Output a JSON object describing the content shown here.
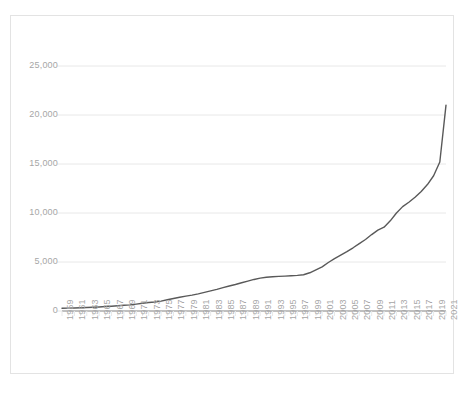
{
  "chart_data": {
    "type": "line",
    "title": "",
    "subtitle": "",
    "xlabel": "",
    "ylabel": "",
    "ylim": [
      0,
      25000
    ],
    "xlim": [
      1959,
      2021
    ],
    "y_ticks": [
      0,
      5000,
      10000,
      15000,
      20000,
      25000
    ],
    "y_tick_labels": [
      "0",
      "5,000",
      "10,000",
      "15,000",
      "20,000",
      "25,000"
    ],
    "x_tick_labels": [
      "1959",
      "1961",
      "1963",
      "1965",
      "1967",
      "1969",
      "1971",
      "1973",
      "1975",
      "1977",
      "1979",
      "1981",
      "1983",
      "1985",
      "1987",
      "1989",
      "1991",
      "1993",
      "1995",
      "1997",
      "1999",
      "2001",
      "2003",
      "2005",
      "2007",
      "2009",
      "2011",
      "2013",
      "2015",
      "2017",
      "2019",
      "2021"
    ],
    "x_tick_step": 2,
    "grid": "horizontal",
    "legend": "none",
    "line_color": "#595959",
    "grid_color": "#e8e8e8",
    "axis_color": "#808080",
    "tick_label_color": "#a6a6a6",
    "border_color": "#e3e3e3",
    "series": [
      {
        "name": "Series 1",
        "x": [
          1959,
          1960,
          1961,
          1962,
          1963,
          1964,
          1965,
          1966,
          1967,
          1968,
          1969,
          1970,
          1971,
          1972,
          1973,
          1974,
          1975,
          1976,
          1977,
          1978,
          1979,
          1980,
          1981,
          1982,
          1983,
          1984,
          1985,
          1986,
          1987,
          1988,
          1989,
          1990,
          1991,
          1992,
          1993,
          1994,
          1995,
          1996,
          1997,
          1998,
          1999,
          2000,
          2001,
          2002,
          2003,
          2004,
          2005,
          2006,
          2007,
          2008,
          2009,
          2010,
          2011,
          2012,
          2013,
          2014,
          2015,
          2016,
          2017,
          2018,
          2019,
          2020,
          2021
        ],
        "values": [
          287,
          298,
          312,
          335,
          357,
          385,
          415,
          452,
          487,
          530,
          580,
          625,
          700,
          790,
          860,
          925,
          1010,
          1150,
          1280,
          1400,
          1520,
          1620,
          1750,
          1900,
          2050,
          2200,
          2380,
          2550,
          2700,
          2880,
          3050,
          3220,
          3350,
          3450,
          3500,
          3530,
          3560,
          3600,
          3640,
          3700,
          3900,
          4200,
          4500,
          4950,
          5350,
          5700,
          6050,
          6450,
          6870,
          7300,
          7800,
          8250,
          8550,
          9200,
          10000,
          10650,
          11100,
          11600,
          12200,
          12900,
          13800,
          15200,
          21000
        ]
      }
    ]
  },
  "axis": {
    "y_labels": [
      "25,000",
      "20,000",
      "15,000",
      "10,000",
      "5,000",
      "0"
    ],
    "x_labels": [
      "1959",
      "1961",
      "1963",
      "1965",
      "1967",
      "1969",
      "1971",
      "1973",
      "1975",
      "1977",
      "1979",
      "1981",
      "1983",
      "1985",
      "1987",
      "1989",
      "1991",
      "1993",
      "1995",
      "1997",
      "1999",
      "2001",
      "2003",
      "2005",
      "2007",
      "2009",
      "2011",
      "2013",
      "2015",
      "2017",
      "2019",
      "2021"
    ]
  }
}
